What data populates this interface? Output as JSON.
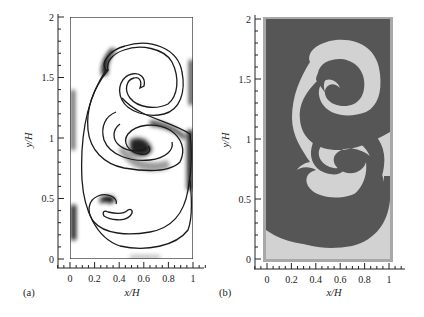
{
  "figure": {
    "panels": [
      {
        "id": "a",
        "label": "(a)",
        "xlabel": "x/H",
        "ylabel": "y/H",
        "xticks": [
          "0",
          "0.2",
          "0.4",
          "0.6",
          "0.8",
          "1"
        ],
        "yticks": [
          "0",
          "0.5",
          "1",
          "1.5",
          "2"
        ],
        "description": "Interface contour with grayscale shading (Rayleigh-Taylor roll-up)"
      },
      {
        "id": "b",
        "label": "(b)",
        "xlabel": "x/H",
        "ylabel": "y/H",
        "xticks": [
          "0",
          "0.2",
          "0.4",
          "0.6",
          "0.8",
          "1"
        ],
        "yticks": [
          "0",
          "0.5",
          "1",
          "1.5",
          "2"
        ],
        "description": "Two-phase fluid field (dark and light regions)"
      }
    ],
    "colors": {
      "axis": "#222222",
      "contour": "#1a1a1a",
      "phase_dark": "#565656",
      "phase_light": "#d2d2d2",
      "frame_b": "#a8a8a8"
    }
  },
  "chart_data": [
    {
      "type": "heatmap",
      "title": "",
      "panel": "(a)",
      "xlabel": "x/H",
      "ylabel": "y/H",
      "xlim": [
        0,
        1
      ],
      "ylim": [
        0,
        2
      ],
      "xticks": [
        0,
        0.2,
        0.4,
        0.6,
        0.8,
        1
      ],
      "yticks": [
        0,
        0.5,
        1,
        1.5,
        2
      ],
      "grid": false
    },
    {
      "type": "heatmap",
      "title": "",
      "panel": "(b)",
      "xlabel": "x/H",
      "ylabel": "y/H",
      "xlim": [
        0,
        1
      ],
      "ylim": [
        0,
        2
      ],
      "xticks": [
        0,
        0.2,
        0.4,
        0.6,
        0.8,
        1
      ],
      "yticks": [
        0,
        0.5,
        1,
        1.5,
        2
      ],
      "grid": false
    }
  ]
}
